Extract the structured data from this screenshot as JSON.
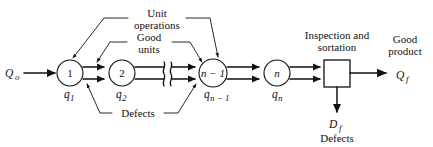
{
  "diagram": {
    "background": "#ffffff",
    "line_color": "#111111",
    "stroke_width": 1.1,
    "width": 433,
    "height": 147
  },
  "inputs": {
    "feed_label": "Q",
    "feed_sub": "o"
  },
  "stations": [
    {
      "id": "s1",
      "label": "1",
      "label_sub": "",
      "cx": 70,
      "cy": 73,
      "r": 13,
      "out_label": "q",
      "out_sub": "1"
    },
    {
      "id": "s2",
      "label": "2",
      "label_sub": "",
      "cx": 122,
      "cy": 73,
      "r": 13,
      "out_label": "q",
      "out_sub": "2"
    },
    {
      "id": "sn1",
      "label": "n − 1",
      "label_sub": "",
      "cx": 213,
      "cy": 73,
      "r": 14,
      "out_label": "q",
      "out_sub": "n − 1"
    },
    {
      "id": "sn",
      "label": "n",
      "label_sub": "",
      "cx": 277,
      "cy": 73,
      "r": 13,
      "out_label": "q",
      "out_sub": "n"
    }
  ],
  "break_marker": {
    "x": 168,
    "y": 73,
    "name": "break-squiggle"
  },
  "inspection": {
    "caption_line1": "Inspection and",
    "caption_line2": "sortation",
    "box": {
      "x": 324,
      "y": 60,
      "w": 26,
      "h": 27
    }
  },
  "outputs": {
    "good_line1": "Good",
    "good_line2": "product",
    "good_symbol": "Q",
    "good_sub": "f",
    "defect_symbol": "D",
    "defect_sub": "f",
    "defect_caption": "Defects"
  },
  "callouts": [
    {
      "id": "unit-operations",
      "line1": "Unit",
      "line2": "operations",
      "x": 157,
      "y": 14
    },
    {
      "id": "good-units",
      "line1": "Good",
      "line2": "units",
      "x": 148,
      "y": 46
    },
    {
      "id": "defects-stream",
      "line1": "Defects",
      "line2": "",
      "x": 130,
      "y": 113
    }
  ]
}
